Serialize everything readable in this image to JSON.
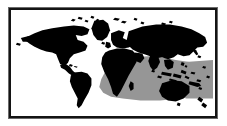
{
  "figure": {
    "kind": "world-map-figure",
    "title": "World map with shaded highlight region",
    "caption": "",
    "frame": {
      "border_color": "#141414",
      "outer_shadow_color": "#6a6a6a",
      "inner_mat_color": "#ffffff"
    }
  },
  "map": {
    "projection_label": "equirectangular",
    "background_color": "#ffffff",
    "land_color": "#000000",
    "ocean_color": "#ffffff",
    "highlight_color": "#969696",
    "highlight_label": "Indian Ocean and Western Pacific shaded band",
    "landmasses": [
      {
        "name": "north-america",
        "label": "North America"
      },
      {
        "name": "south-america",
        "label": "South America"
      },
      {
        "name": "greenland",
        "label": "Greenland"
      },
      {
        "name": "europe",
        "label": "Europe"
      },
      {
        "name": "africa",
        "label": "Africa"
      },
      {
        "name": "asia",
        "label": "Asia"
      },
      {
        "name": "australia",
        "label": "Australia"
      },
      {
        "name": "new-zealand",
        "label": "New Zealand"
      },
      {
        "name": "indonesia",
        "label": "Indonesian archipelago"
      },
      {
        "name": "japan",
        "label": "Japan"
      },
      {
        "name": "madagascar",
        "label": "Madagascar"
      },
      {
        "name": "british-isles",
        "label": "British Isles"
      },
      {
        "name": "arctic-islands",
        "label": "Arctic islands"
      }
    ]
  }
}
